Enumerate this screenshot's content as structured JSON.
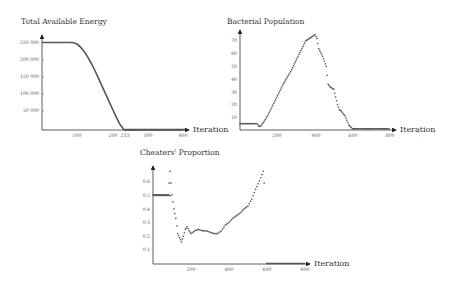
{
  "chart_data": [
    {
      "type": "line",
      "title": "Total Available Energy",
      "xlabel": "Iteration",
      "ylabel": "",
      "x_ticks": [
        "100",
        "200",
        "233",
        "300",
        "400"
      ],
      "y_ticks": [
        "50 000",
        "100 000",
        "150 000",
        "200 000",
        "250 000"
      ],
      "xlim": [
        0,
        420
      ],
      "ylim": [
        0,
        250000
      ],
      "grid": false,
      "x": [
        0,
        80,
        90,
        100,
        110,
        120,
        130,
        140,
        150,
        160,
        170,
        180,
        190,
        200,
        210,
        220,
        233,
        300,
        400
      ],
      "values": [
        250000,
        250000,
        249000,
        245000,
        236000,
        224000,
        208000,
        190000,
        170000,
        148000,
        126000,
        104000,
        82000,
        60000,
        38000,
        18000,
        0,
        0,
        0
      ]
    },
    {
      "type": "scatter",
      "title": "Bacterial Population",
      "xlabel": "Iteration",
      "ylabel": "",
      "x_ticks": [
        "200",
        "400",
        "600",
        "800"
      ],
      "y_ticks": [
        "10",
        "20",
        "30",
        "40",
        "50",
        "60",
        "70"
      ],
      "xlim": [
        0,
        850
      ],
      "ylim": [
        0,
        76
      ],
      "grid": false,
      "x": [
        0,
        50,
        90,
        100,
        110,
        130,
        150,
        170,
        190,
        210,
        230,
        250,
        270,
        290,
        310,
        330,
        350,
        370,
        390,
        400,
        410,
        420,
        440,
        460,
        470,
        480,
        500,
        520,
        530,
        540,
        560,
        580,
        600,
        620,
        700,
        800
      ],
      "values": [
        5,
        5,
        5,
        3,
        3,
        7,
        12,
        18,
        24,
        30,
        36,
        41,
        46,
        52,
        58,
        64,
        70,
        72,
        74,
        75,
        72,
        64,
        58,
        50,
        36,
        34,
        32,
        20,
        16,
        15,
        11,
        4,
        1,
        1,
        1,
        1
      ]
    },
    {
      "type": "scatter",
      "title": "Cheaters' Proportion",
      "xlabel": "Iteration",
      "ylabel": "",
      "x_ticks": [
        "200",
        "400",
        "600",
        "800"
      ],
      "y_ticks": [
        "0.1",
        "0.2",
        "0.3",
        "0.4",
        "0.5",
        "0.6"
      ],
      "xlim": [
        0,
        850
      ],
      "ylim": [
        0,
        0.7
      ],
      "grid": false,
      "x": [
        0,
        40,
        80,
        90,
        100,
        110,
        120,
        130,
        140,
        150,
        160,
        170,
        180,
        190,
        200,
        220,
        240,
        260,
        280,
        300,
        320,
        340,
        360,
        380,
        400,
        420,
        440,
        460,
        480,
        500,
        520,
        540,
        560,
        580,
        590
      ],
      "values": [
        0.5,
        0.5,
        0.5,
        0.67,
        0.5,
        0.4,
        0.33,
        0.22,
        0.19,
        0.16,
        0.2,
        0.25,
        0.27,
        0.24,
        0.22,
        0.24,
        0.25,
        0.24,
        0.24,
        0.23,
        0.22,
        0.22,
        0.24,
        0.28,
        0.3,
        0.33,
        0.35,
        0.37,
        0.4,
        0.42,
        0.47,
        0.54,
        0.6,
        0.67,
        0.5
      ]
    }
  ],
  "charts": {
    "energy": {
      "title": "Total Available Energy",
      "xlabel": "Iteration",
      "xt": [
        "100",
        "200",
        "233",
        "300",
        "400"
      ],
      "yt": [
        "250 000",
        "200 000",
        "150 000",
        "100 000",
        "50 000"
      ]
    },
    "bacteria": {
      "title": "Bacterial Population",
      "xlabel": "Iteration",
      "xt": [
        "200",
        "400",
        "600",
        "800"
      ],
      "yt": [
        "70",
        "60",
        "50",
        "40",
        "30",
        "20",
        "10"
      ]
    },
    "cheaters": {
      "title": "Cheaters' Proportion",
      "xlabel": "Iteration",
      "xt": [
        "200",
        "400",
        "600",
        "800"
      ],
      "yt": [
        "0.6",
        "0.5",
        "0.4",
        "0.3",
        "0.2",
        "0.1"
      ]
    }
  }
}
